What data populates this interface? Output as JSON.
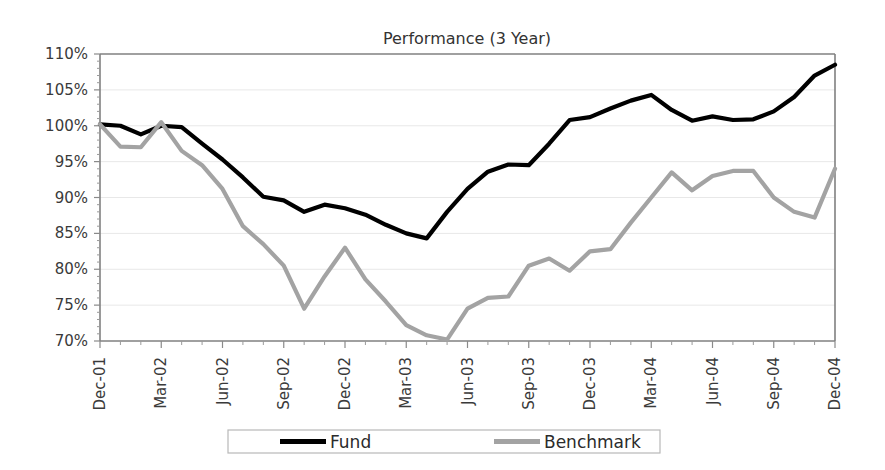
{
  "chart_data": {
    "type": "line",
    "title": "Performance (3 Year)",
    "xlabel": "",
    "ylabel": "",
    "ylim": [
      70,
      110
    ],
    "ytick_step": 5,
    "ytick_labels": [
      "110%",
      "105%",
      "100%",
      "95%",
      "90%",
      "85%",
      "80%",
      "75%",
      "70%"
    ],
    "ytick_values": [
      110,
      105,
      100,
      95,
      90,
      85,
      80,
      75,
      70
    ],
    "grid": true,
    "legend_position": "bottom",
    "x": [
      "Dec-01",
      "Jan-02",
      "Feb-02",
      "Mar-02",
      "Apr-02",
      "May-02",
      "Jun-02",
      "Jul-02",
      "Aug-02",
      "Sep-02",
      "Oct-02",
      "Nov-02",
      "Dec-02",
      "Jan-03",
      "Feb-03",
      "Mar-03",
      "Apr-03",
      "May-03",
      "Jun-03",
      "Jul-03",
      "Aug-03",
      "Sep-03",
      "Oct-03",
      "Nov-03",
      "Dec-03",
      "Jan-04",
      "Feb-04",
      "Mar-04",
      "Apr-04",
      "May-04",
      "Jun-04",
      "Jul-04",
      "Aug-04",
      "Sep-04",
      "Oct-04",
      "Nov-04",
      "Dec-04"
    ],
    "xtick_labels": [
      "Dec-01",
      "Mar-02",
      "Jun-02",
      "Sep-02",
      "Dec-02",
      "Mar-03",
      "Jun-03",
      "Sep-03",
      "Dec-03",
      "Mar-04",
      "Jun-04",
      "Sep-04",
      "Dec-04"
    ],
    "xtick_indices": [
      0,
      3,
      6,
      9,
      12,
      15,
      18,
      21,
      24,
      27,
      30,
      33,
      36
    ],
    "series": [
      {
        "name": "Fund",
        "color": "#000000",
        "width": 4.2,
        "values": [
          100.2,
          100.0,
          98.8,
          100.0,
          99.8,
          97.5,
          95.3,
          92.8,
          90.1,
          89.6,
          88.0,
          89.0,
          88.5,
          87.6,
          86.2,
          85.0,
          84.3,
          88.0,
          91.2,
          93.6,
          94.6,
          94.5,
          97.5,
          100.8,
          101.2,
          102.4,
          103.5,
          104.3,
          102.2,
          100.7,
          101.3,
          100.8,
          100.9,
          102.0,
          104.0,
          107.0,
          108.5
        ]
      },
      {
        "name": "Benchmark",
        "color": "#a3a3a3",
        "width": 4.2,
        "values": [
          100.2,
          97.1,
          97.0,
          100.5,
          96.5,
          94.5,
          91.2,
          86.0,
          83.5,
          80.5,
          74.5,
          79.0,
          83.0,
          78.6,
          75.5,
          72.2,
          70.8,
          70.2,
          74.5,
          76.0,
          76.2,
          80.5,
          81.5,
          79.8,
          82.5,
          82.8,
          86.5,
          90.0,
          93.5,
          91.0,
          93.0,
          93.7,
          93.7,
          90.0,
          88.0,
          87.2,
          94.0
        ]
      }
    ]
  },
  "legend": {
    "entries": [
      {
        "label": "Fund",
        "color": "#000000"
      },
      {
        "label": "Benchmark",
        "color": "#a3a3a3"
      }
    ]
  }
}
